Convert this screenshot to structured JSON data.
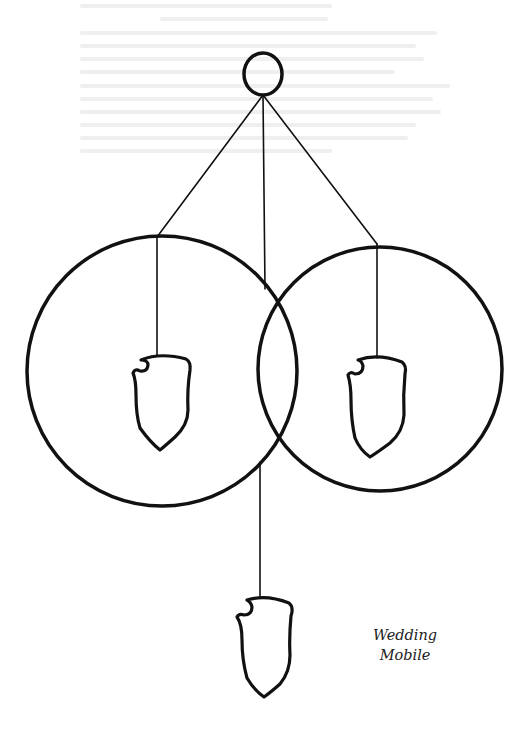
{
  "title": "Wedding Mobile",
  "caption": {
    "line1": "Wedding",
    "line2": "Mobile"
  },
  "colors": {
    "ink": "#111111",
    "background": "#ffffff"
  },
  "elements": {
    "top_ring": {
      "cx": 263,
      "cy": 74,
      "rx": 19,
      "ry": 21
    },
    "left_circle": {
      "cx": 162,
      "cy": 371,
      "r": 135
    },
    "right_circle": {
      "cx": 380,
      "cy": 369,
      "r": 122
    },
    "shields": [
      "left-shield",
      "right-shield",
      "bottom-shield"
    ]
  }
}
